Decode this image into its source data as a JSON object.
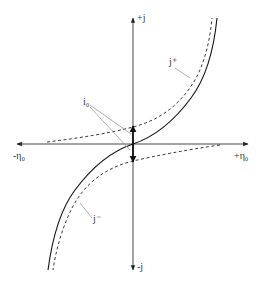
{
  "diagram": {
    "axes": {
      "y_positive_label": "+j",
      "y_negative_label": "-j",
      "x_positive_label": "+η₀",
      "x_negative_label": "-η₀"
    },
    "curves": [
      {
        "name": "net current",
        "label": "j",
        "style": "solid"
      },
      {
        "name": "anodic partial current",
        "label": "j⁺",
        "style": "dashed"
      },
      {
        "name": "cathodic partial current",
        "label": "j⁻",
        "style": "dashed"
      }
    ],
    "labels": {
      "j_plus": "j⁺",
      "j_minus": "j⁻",
      "exchange_current": "i₀"
    },
    "colors": {
      "line": "#222222",
      "leader": "#999999",
      "background": "#ffffff"
    }
  }
}
